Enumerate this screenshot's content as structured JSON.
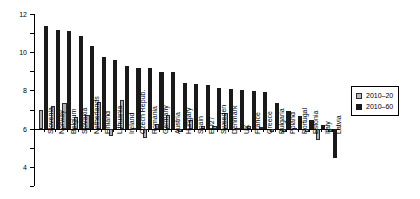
{
  "chart_data": {
    "type": "bar",
    "title": "",
    "subtitle": "",
    "xlabel": "",
    "ylabel": "",
    "ylim": [
      -6,
      12
    ],
    "ytick_labels": [
      "12",
      "10",
      "8",
      "6",
      "4",
      "2",
      "0",
      "-2",
      "-4",
      "-6"
    ],
    "yticks": [
      12,
      10,
      8,
      6,
      4,
      2,
      0,
      -2,
      -4,
      -6
    ],
    "grid": false,
    "legend_position": "right",
    "categories": [
      "Slovenia",
      "Norway",
      "Belgium",
      "Slovakia",
      "Netherlands",
      "Finland",
      "Lithuania",
      "Ireland",
      "Czech Repub.",
      "Romania",
      "Germany",
      "Austria",
      "Hungary",
      "Spain",
      "EU27",
      "Sweeden",
      "Denmark",
      "UK",
      "France",
      "Greece",
      "Bulgaria",
      "Poland",
      "Portugal",
      "Estonia",
      "Italy",
      "Latvia"
    ],
    "series": [
      {
        "name": "2010–20",
        "color": "#b0b0b0",
        "values": [
          2.0,
          2.4,
          2.65,
          1.25,
          1.4,
          2.8,
          -0.8,
          3.05,
          0.1,
          -0.95,
          0.5,
          1.4,
          -0.3,
          0.95,
          0.3,
          0.3,
          1.6,
          0.05,
          0.3,
          0.15,
          -0.3,
          -0.4,
          0.05,
          -0.4,
          -1.15,
          -0.3
        ]
      },
      {
        "name": "2010–60",
        "color": "#1a1a1a",
        "values": [
          10.75,
          10.3,
          10.2,
          9.7,
          8.7,
          7.5,
          7.2,
          6.6,
          6.3,
          6.3,
          5.95,
          5.95,
          4.75,
          4.7,
          4.55,
          4.3,
          4.2,
          4.05,
          3.95,
          3.8,
          2.65,
          1.85,
          1.3,
          0.9,
          0.4,
          -3.1
        ]
      }
    ]
  },
  "legend": {
    "items": [
      {
        "label": "2010–20"
      },
      {
        "label": "2010–60"
      }
    ]
  }
}
